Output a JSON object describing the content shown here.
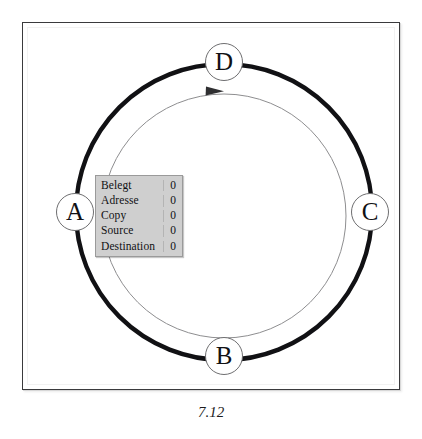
{
  "figure": {
    "caption": "7.12",
    "frame": {
      "border_color": "#3a3a3c",
      "background": "#ffffff"
    }
  },
  "diagram": {
    "type": "ring-cycle",
    "outer_ring": {
      "name": "thick-ring",
      "color": "#111114",
      "stroke_width": 4.2,
      "center_x": 224,
      "center_y": 212,
      "radius": 148
    },
    "inner_ring": {
      "name": "thin-ring",
      "color": "#8e8e90",
      "stroke_width": 1,
      "center_x": 224,
      "center_y": 216,
      "radius": 122,
      "direction": "clockwise",
      "arrow_color": "#3b3b3d"
    },
    "nodes": [
      {
        "id": "a",
        "label": "A",
        "x": 75,
        "y": 212
      },
      {
        "id": "b",
        "label": "B",
        "x": 224,
        "y": 356
      },
      {
        "id": "c",
        "label": "C",
        "x": 370,
        "y": 212
      },
      {
        "id": "d",
        "label": "D",
        "x": 224,
        "y": 62
      }
    ]
  },
  "status_table": {
    "name": "status-panel",
    "background": "#cfcfcf",
    "rows": [
      {
        "label": "Belegt",
        "value": "0"
      },
      {
        "label": "Adresse",
        "value": "0"
      },
      {
        "label": "Copy",
        "value": "0"
      },
      {
        "label": "Source",
        "value": "0"
      },
      {
        "label": "Destination",
        "value": "0"
      }
    ]
  }
}
